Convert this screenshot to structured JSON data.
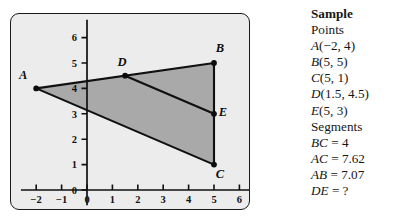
{
  "figure": {
    "panel": {
      "background": "#ececec",
      "border_color": "#1a1a1a",
      "fill_color": "#a9a9a9",
      "line_color": "#101010"
    }
  },
  "chart_data": {
    "type": "scatter",
    "title": "",
    "xlabel": "",
    "ylabel": "",
    "xlim": [
      -2.6,
      6.6
    ],
    "ylim": [
      -0.6,
      6.7
    ],
    "xticks": [
      -2,
      -1,
      0,
      1,
      2,
      3,
      4,
      5,
      6
    ],
    "xtick_labels": [
      "−2",
      "−1",
      "0",
      "1",
      "2",
      "3",
      "4",
      "5",
      "6"
    ],
    "yticks": [
      0,
      1,
      2,
      3,
      4,
      5,
      6
    ],
    "ytick_labels": [
      "0",
      "1",
      "2",
      "3",
      "4",
      "5",
      "6"
    ],
    "grid": false,
    "points": [
      {
        "label": "A",
        "x": -2,
        "y": 4,
        "label_dx": -13,
        "label_dy": -9
      },
      {
        "label": "B",
        "x": 5,
        "y": 5,
        "label_dx": 6,
        "label_dy": -11
      },
      {
        "label": "C",
        "x": 5,
        "y": 1,
        "label_dx": 6,
        "label_dy": 13
      },
      {
        "label": "D",
        "x": 1.5,
        "y": 4.5,
        "label_dx": -3,
        "label_dy": -10
      },
      {
        "label": "E",
        "x": 5,
        "y": 3,
        "label_dx": 9,
        "label_dy": 2
      }
    ],
    "segments": [
      {
        "name": "AB",
        "from": "A",
        "to": "B"
      },
      {
        "name": "BC",
        "from": "B",
        "to": "C"
      },
      {
        "name": "CA",
        "from": "C",
        "to": "A"
      },
      {
        "name": "DE",
        "from": "D",
        "to": "E"
      }
    ],
    "shaded_polygon": [
      "A",
      "B",
      "C"
    ],
    "annotations": []
  },
  "sidebar": {
    "heading": "Sample",
    "points_heading": "Points",
    "points": [
      {
        "name": "A",
        "coords": "(−2, 4)"
      },
      {
        "name": "B",
        "coords": "(5, 5)"
      },
      {
        "name": "C",
        "coords": "(5, 1)"
      },
      {
        "name": "D",
        "coords": "(1.5, 4.5)"
      },
      {
        "name": "E",
        "coords": "(5, 3)"
      }
    ],
    "segments_heading": "Segments",
    "segments": [
      {
        "name": "BC",
        "value": " = 4"
      },
      {
        "name": "AC",
        "value": " = 7.62"
      },
      {
        "name": "AB",
        "value": " = 7.07"
      },
      {
        "name": "DE",
        "value": " = ?"
      }
    ]
  }
}
